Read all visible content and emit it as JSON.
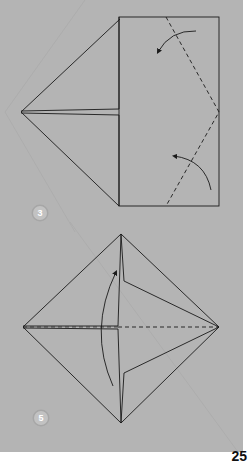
{
  "page": {
    "page_number": "25",
    "panel_color": "#b4b4b4",
    "line_color": "#1a1a1a"
  },
  "steps": [
    {
      "number": "3",
      "description": "Square with left half folded into point; valley-fold the right corners in along dashed lines",
      "arrows": [
        "curved-arrow-fold-top-right-corner",
        "curved-arrow-fold-bottom-right-corner"
      ],
      "fold_lines": [
        "valley-fold-upper-right",
        "valley-fold-lower-right"
      ]
    },
    {
      "number": "5",
      "description": "Diamond base; fold bottom half up along horizontal dashed line",
      "arrows": [
        "curved-arrow-fold-up"
      ],
      "fold_lines": [
        "valley-fold-horizontal-center"
      ]
    }
  ]
}
